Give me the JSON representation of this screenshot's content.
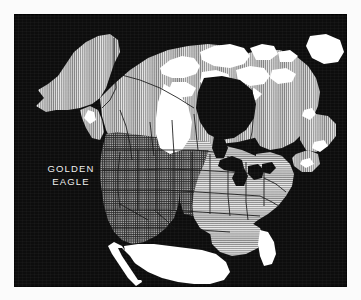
{
  "page": {
    "background_color": "#fbfbfb",
    "width": 361,
    "height": 300
  },
  "map_panel": {
    "background_color": "#0d0d0d",
    "ocean_color": "#0d0d0d",
    "outside_range_color": "#ffffff",
    "border_color": "#000000",
    "subject": "North America"
  },
  "caption": {
    "line1": "GOLDEN",
    "line2": "EAGLE",
    "full_text": "GOLDEN EAGLE",
    "color": "#f2f2f2"
  },
  "legend_zones": [
    {
      "id": "breeding",
      "name": "breeding-range",
      "pattern": "vertical-hatch",
      "fill_color": "#b9b9b9",
      "line_color": "#f0f0f0",
      "regions": [
        "Alaska",
        "Yukon",
        "Northwest Territories",
        "Nunavut mainland",
        "northern Quebec",
        "Labrador",
        "Newfoundland",
        "northern Ontario",
        "Manitoba",
        "Saskatchewan",
        "Alberta",
        "British Columbia"
      ]
    },
    {
      "id": "resident",
      "name": "year-round-range",
      "pattern": "cross-hatch",
      "fill_color": "#8a8a8a",
      "line_color": "#2a2a2a",
      "regions": [
        "Washington",
        "Oregon",
        "California",
        "Idaho",
        "Nevada",
        "Utah",
        "Arizona",
        "Montana",
        "Wyoming",
        "Colorado",
        "New Mexico",
        "western Texas",
        "western Dakotas"
      ]
    },
    {
      "id": "wintering",
      "name": "winter-range",
      "pattern": "horizontal-hatch",
      "fill_color": "#bdbdbd",
      "line_color": "#efefef",
      "regions": [
        "Great Plains",
        "Midwest",
        "Ohio Valley",
        "Appalachians",
        "Mid-Atlantic",
        "New England",
        "southeastern United States",
        "eastern Texas"
      ]
    },
    {
      "id": "absent",
      "name": "outside-range",
      "pattern": "solid-white",
      "fill_color": "#ffffff",
      "line_color": "#ffffff",
      "regions": [
        "Canadian Arctic Archipelago",
        "Greenland edge",
        "Mexico",
        "Florida",
        "Hudson Bay lowlands wedge"
      ]
    }
  ],
  "water_bodies": [
    {
      "name": "Hudson Bay",
      "color": "#0d0d0d"
    },
    {
      "name": "Great Lakes",
      "color": "#0d0d0d"
    },
    {
      "name": "Gulf of California",
      "color": "#0d0d0d"
    },
    {
      "name": "Atlantic Ocean",
      "color": "#0d0d0d"
    },
    {
      "name": "Pacific Ocean",
      "color": "#0d0d0d"
    },
    {
      "name": "Gulf of Mexico",
      "color": "#0d0d0d"
    }
  ]
}
